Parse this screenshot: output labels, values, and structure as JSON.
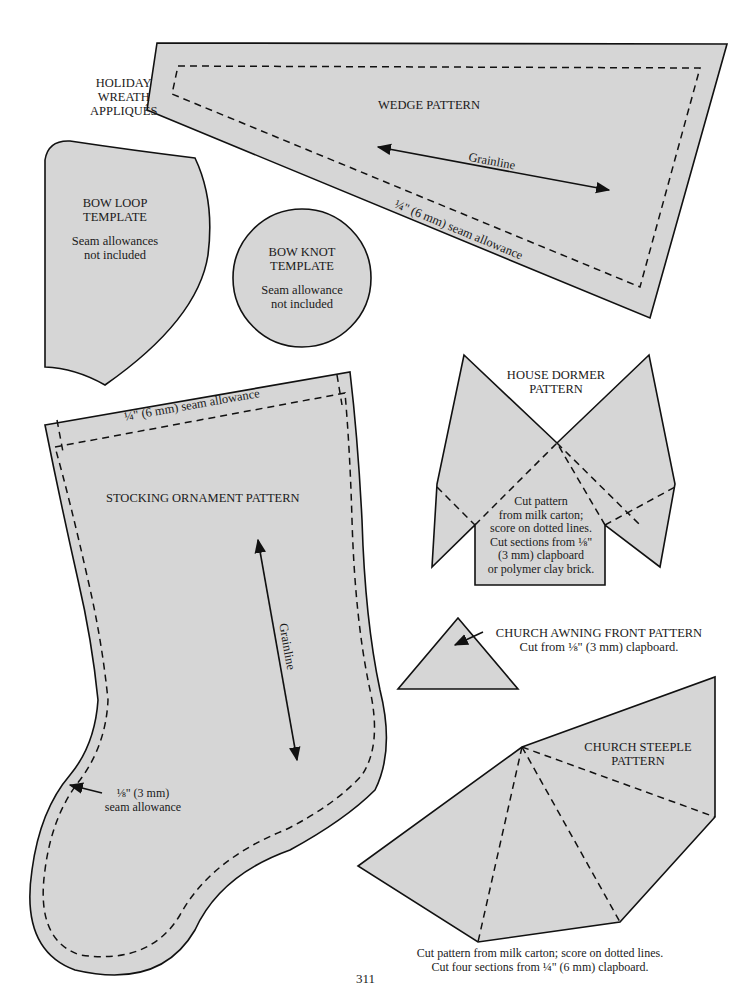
{
  "page": {
    "number": "311",
    "fill_color": "#d6d6d6",
    "line_color": "#111111"
  },
  "section_title": {
    "lines": [
      "HOLIDAY",
      "WREATH",
      "APPLIQUÉS"
    ]
  },
  "wedge": {
    "title": "WEDGE PATTERN",
    "grainline": "Grainline",
    "seam_note": "¼\" (6 mm) seam allowance"
  },
  "bow_loop": {
    "title_1": "BOW LOOP",
    "title_2": "TEMPLATE",
    "note_1": "Seam allowances",
    "note_2": "not included"
  },
  "bow_knot": {
    "title_1": "BOW KNOT",
    "title_2": "TEMPLATE",
    "note_1": "Seam allowance",
    "note_2": "not included"
  },
  "house_dormer": {
    "title_1": "HOUSE DORMER",
    "title_2": "PATTERN",
    "instructions": [
      "Cut pattern",
      "from milk carton;",
      "score on dotted lines.",
      "Cut sections from ⅛\"",
      "(3 mm) clapboard",
      "or polymer clay brick."
    ]
  },
  "stocking": {
    "title": "STOCKING ORNAMENT PATTERN",
    "top_seam_note": "¼\" (6 mm) seam allowance",
    "grainline": "Grainline",
    "side_seam_note_1": "⅛\" (3 mm)",
    "side_seam_note_2": "seam allowance"
  },
  "church_awning": {
    "title": "CHURCH AWNING FRONT PATTERN",
    "note": "Cut from ⅛\" (3 mm) clapboard."
  },
  "church_steeple": {
    "title_1": "CHURCH STEEPLE",
    "title_2": "PATTERN",
    "note_1": "Cut pattern from milk carton; score on dotted lines.",
    "note_2": "Cut four sections from ¼\" (6 mm) clapboard."
  }
}
